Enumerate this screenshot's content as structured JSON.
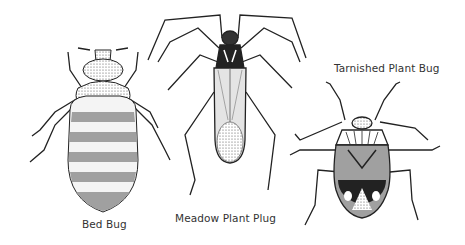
{
  "figure": {
    "title": "",
    "specimens": [
      {
        "id": "bed-bug",
        "label": "Bed Bug"
      },
      {
        "id": "meadow-plant-bug",
        "label": "Meadow Plant Plug"
      },
      {
        "id": "tarnished-plant-bug",
        "label": "Tarnished Plant Bug"
      }
    ]
  },
  "colors": {
    "background": "#ffffff",
    "ink": "#222222",
    "shade": "#777777",
    "light_shade": "#bbbbbb"
  }
}
